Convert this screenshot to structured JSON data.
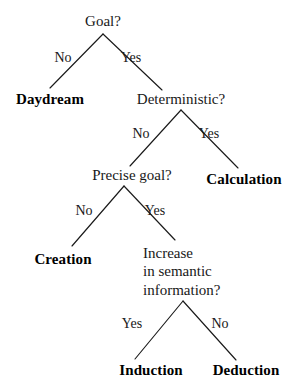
{
  "diagram": {
    "type": "decision-tree",
    "title": "",
    "background_color": "#ffffff",
    "line_color": "#1a1a1a",
    "text_color": "#181818",
    "leaf_text_color": "#000000",
    "nodes": [
      {
        "id": "goal",
        "label": "Goal?",
        "kind": "decision",
        "x": 103,
        "y": 22
      },
      {
        "id": "daydream",
        "label": "Daydream",
        "kind": "leaf",
        "x": 50,
        "y": 100
      },
      {
        "id": "determ",
        "label": "Deterministic?",
        "kind": "decision",
        "x": 181,
        "y": 100
      },
      {
        "id": "calculation",
        "label": "Calculation",
        "kind": "leaf",
        "x": 244,
        "y": 180
      },
      {
        "id": "precise",
        "label": "Precise goal?",
        "kind": "decision",
        "x": 132,
        "y": 176
      },
      {
        "id": "creation",
        "label": "Creation",
        "kind": "leaf",
        "x": 63,
        "y": 260
      },
      {
        "id": "increase",
        "label": "Increase in semantic information?",
        "kind": "decision",
        "x": 143,
        "y": 246,
        "lines": [
          "Increase",
          "in semantic",
          "information?"
        ]
      },
      {
        "id": "induction",
        "label": "Induction",
        "kind": "leaf",
        "x": 151,
        "y": 371
      },
      {
        "id": "deduction",
        "label": "Deduction",
        "kind": "leaf",
        "x": 246,
        "y": 371
      }
    ],
    "edges": [
      {
        "from": "goal",
        "to": "daydream",
        "label": "No",
        "label_x": 63,
        "label_y": 58
      },
      {
        "from": "goal",
        "to": "determ",
        "label": "Yes",
        "label_x": 131,
        "label_y": 58
      },
      {
        "from": "determ",
        "to": "precise",
        "label": "No",
        "label_x": 141,
        "label_y": 134
      },
      {
        "from": "determ",
        "to": "calculation",
        "label": "Yes",
        "label_x": 209,
        "label_y": 134
      },
      {
        "from": "precise",
        "to": "creation",
        "label": "No",
        "label_x": 84,
        "label_y": 211
      },
      {
        "from": "precise",
        "to": "increase",
        "label": "Yes",
        "label_x": 155,
        "label_y": 211
      },
      {
        "from": "increase",
        "to": "induction",
        "label": "Yes",
        "label_x": 132,
        "label_y": 324
      },
      {
        "from": "increase",
        "to": "deduction",
        "label": "No",
        "label_x": 220,
        "label_y": 324
      }
    ],
    "lines": [
      {
        "id": "goal-left",
        "x1": 103,
        "y1": 34,
        "x2": 50,
        "y2": 88
      },
      {
        "id": "goal-right",
        "x1": 103,
        "y1": 34,
        "x2": 162,
        "y2": 90
      },
      {
        "id": "determ-left",
        "x1": 181,
        "y1": 110,
        "x2": 130,
        "y2": 166
      },
      {
        "id": "determ-right",
        "x1": 181,
        "y1": 110,
        "x2": 238,
        "y2": 168
      },
      {
        "id": "precise-left",
        "x1": 124,
        "y1": 186,
        "x2": 72,
        "y2": 246
      },
      {
        "id": "precise-right",
        "x1": 124,
        "y1": 186,
        "x2": 175,
        "y2": 240
      },
      {
        "id": "increase-left",
        "x1": 183,
        "y1": 301,
        "x2": 135,
        "y2": 359
      },
      {
        "id": "increase-right",
        "x1": 183,
        "y1": 301,
        "x2": 236,
        "y2": 360
      }
    ]
  }
}
